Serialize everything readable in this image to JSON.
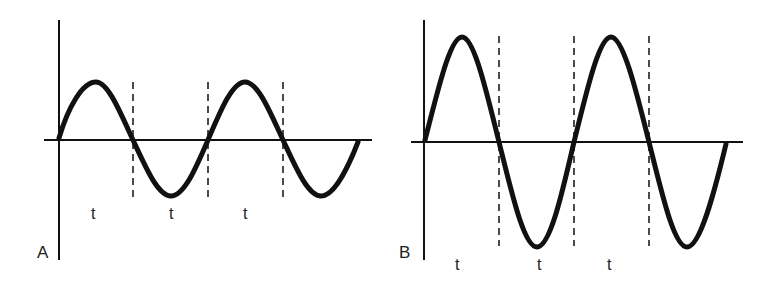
{
  "figure": {
    "panels": [
      {
        "id": "A",
        "label": "A",
        "period_labels": [
          "t",
          "t",
          "t"
        ],
        "description": "Sine wave of small amplitude"
      },
      {
        "id": "B",
        "label": "B",
        "period_labels": [
          "t",
          "t",
          "t"
        ],
        "description": "Sine wave of large amplitude, same period"
      }
    ]
  },
  "colors": {
    "line": "#111111",
    "background": "#ffffff"
  }
}
